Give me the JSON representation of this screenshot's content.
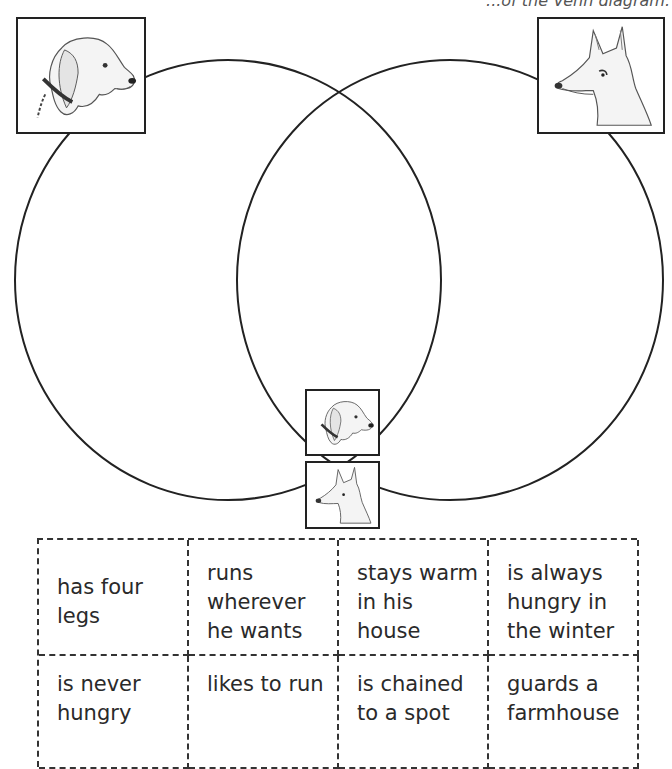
{
  "header": {
    "cutoff_text": "...of the Venn diagram."
  },
  "venn": {
    "left_circle": {
      "cx": 228,
      "cy": 280,
      "rx": 213,
      "ry": 220,
      "label_image": "dog-head"
    },
    "right_circle": {
      "cx": 450,
      "cy": 280,
      "rx": 213,
      "ry": 220,
      "label_image": "fox-head"
    },
    "stroke_color": "#222222"
  },
  "images": {
    "left_large": "dog-head-icon",
    "right_large": "fox-head-icon",
    "center_top": "dog-head-icon",
    "center_bottom": "fox-head-icon"
  },
  "cards": {
    "rows": [
      [
        "has four legs",
        "runs wherever he wants",
        "stays warm in his house",
        "is always hungry in the winter"
      ],
      [
        "is never hungry",
        "likes to run",
        "is chained to a spot",
        "guards a farmhouse"
      ]
    ]
  }
}
